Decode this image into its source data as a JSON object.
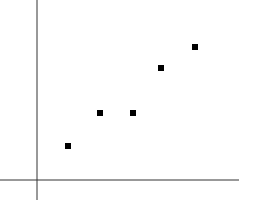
{
  "chart_data": {
    "type": "scatter",
    "title": "",
    "xlabel": "",
    "ylabel": "",
    "grid": false,
    "legend": null,
    "x": [
      1,
      2,
      3,
      3.9,
      4.9
    ],
    "y": [
      1,
      2,
      2,
      3.4,
      4
    ],
    "xlim": [
      0,
      6.3
    ],
    "ylim": [
      -0.6,
      5.45
    ],
    "marker": "square",
    "marker_color": "#000000",
    "axis_color": "#333333",
    "pixel_points": [
      [
        68,
        146
      ],
      [
        100,
        113
      ],
      [
        133,
        113
      ],
      [
        161,
        68
      ],
      [
        195,
        47
      ]
    ],
    "axes_pixels": {
      "origin": [
        37,
        180
      ],
      "x_axis_end": 239,
      "x_axis_start": 0,
      "y_axis_top": 0,
      "y_axis_bottom": 200
    }
  }
}
